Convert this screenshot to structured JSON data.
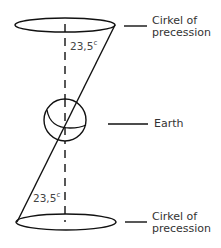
{
  "diagram": {
    "labels": {
      "top_circle": [
        "Cirkel of",
        "precession"
      ],
      "earth": "Earth",
      "bottom_circle": [
        "Cirkel of",
        "precession"
      ]
    },
    "angles": {
      "top": {
        "value": "23,5",
        "unit": "c"
      },
      "bottom": {
        "value": "23,5",
        "unit": "c"
      }
    },
    "colors": {
      "stroke": "#111111",
      "text": "#333333"
    }
  }
}
